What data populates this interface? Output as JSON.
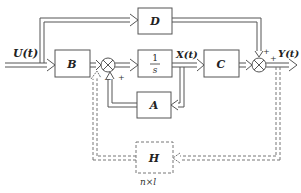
{
  "diagram": {
    "type": "state-space block diagram with state feedback",
    "input_label": "U(t)",
    "output_label": "Y(t)",
    "state_label": "X(t)",
    "blocks": {
      "B": "B",
      "D": "D",
      "integrator_num": "1",
      "integrator_den": "s",
      "C": "C",
      "A": "A",
      "H": "H"
    },
    "h_dimension": "n×l",
    "signs": {
      "sum1_left": "+",
      "sum1_feedback_h": "−",
      "sum1_feedback_a": "+",
      "sum2_top": "+",
      "sum2_left": "+"
    },
    "colors": {
      "line": "#555555",
      "dashed": "#777777",
      "text": "#222222"
    }
  }
}
